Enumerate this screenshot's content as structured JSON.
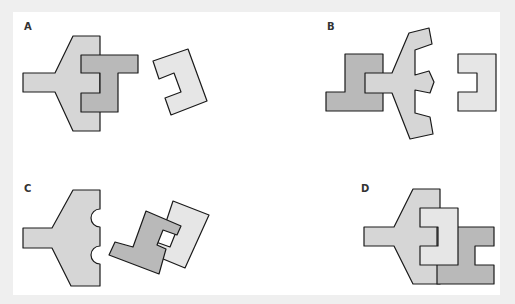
{
  "figure": {
    "type": "multiple-choice shape-assembly puzzle",
    "options": [
      {
        "id": "A",
        "label": "A",
        "description": "Arrow-shaped piece overlapped by dark E-shaped piece; separate pale C-shaped piece rotated to the right"
      },
      {
        "id": "B",
        "label": "B",
        "description": "Dark L-shaped piece joined to arrow piece with rounded notches; separate pale C-shaped piece"
      },
      {
        "id": "C",
        "label": "C",
        "description": "Arrow piece with two semicircular notches; dark and pale interlocking pieces rotated"
      },
      {
        "id": "D",
        "label": "D",
        "description": "Arrow piece with pale E-shaped piece and dark I-shaped piece assembled together"
      }
    ]
  },
  "colors": {
    "background": "#efefef",
    "panel": "#ffffff",
    "piece_light": "#d6d6d6",
    "piece_dark": "#b9b9b9",
    "piece_pale": "#e6e6e6",
    "outline": "#1a1a1a"
  }
}
